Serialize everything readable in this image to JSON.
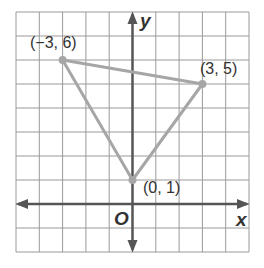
{
  "chart_data": {
    "type": "scatter",
    "title": "",
    "xlabel": "x",
    "ylabel": "y",
    "origin_label": "O",
    "xlim": [
      -5,
      5
    ],
    "ylim": [
      -2,
      8
    ],
    "grid": true,
    "shape": "triangle",
    "points": [
      {
        "x": -3,
        "y": 6,
        "label": "(−3, 6)"
      },
      {
        "x": 3,
        "y": 5,
        "label": "(3, 5)"
      },
      {
        "x": 0,
        "y": 1,
        "label": "(0, 1)"
      }
    ]
  },
  "colors": {
    "grid": "#9a9a9a",
    "axes": "#555555",
    "triangle": "#a6a6a6",
    "text": "#333333"
  }
}
